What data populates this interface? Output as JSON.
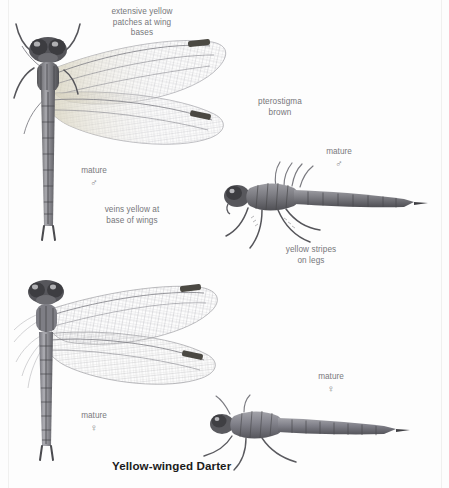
{
  "plate": {
    "caption": "Yellow-winged Darter",
    "background_color": "#fdfdfd",
    "text_color": "#76767a",
    "caption_color": "#1b1b1b"
  },
  "annotations": [
    {
      "id": "wing-base-patches",
      "text": "extensive yellow\npatches at wing\nbases"
    },
    {
      "id": "pterostigma",
      "text": "pterostigma\nbrown"
    },
    {
      "id": "veins-yellow",
      "text": "veins yellow at\nbase of wings"
    },
    {
      "id": "leg-stripes",
      "text": "yellow stripes\non legs"
    }
  ],
  "specimens": [
    {
      "id": "male-dorsal",
      "stage": "mature",
      "sex_symbol": "♂",
      "view": "dorsal"
    },
    {
      "id": "male-lateral",
      "stage": "mature",
      "sex_symbol": "♂",
      "view": "lateral"
    },
    {
      "id": "female-dorsal",
      "stage": "mature",
      "sex_symbol": "♀",
      "view": "dorsal"
    },
    {
      "id": "female-lateral",
      "stage": "mature",
      "sex_symbol": "♀",
      "view": "lateral"
    }
  ]
}
